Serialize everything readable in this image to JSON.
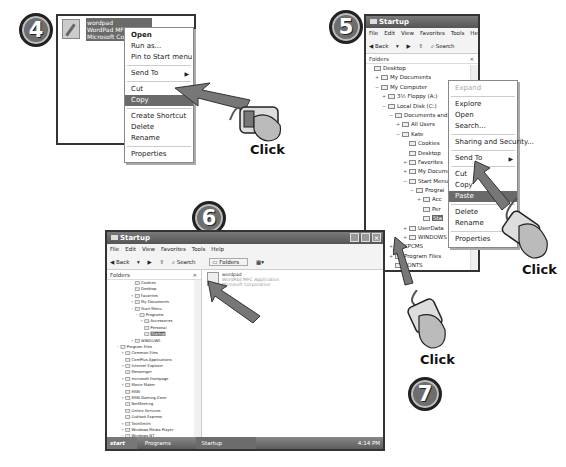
{
  "steps": [
    {
      "number": "4"
    },
    {
      "number": "5"
    },
    {
      "number": "6"
    },
    {
      "number": "7"
    }
  ],
  "click_labels": [
    "Click",
    "Click",
    "Click"
  ],
  "step4": {
    "file": {
      "name": "wordpad",
      "type": "WordPad MFC",
      "company": "Microsoft Corp"
    },
    "context_menu": [
      {
        "label": "Open",
        "bold": true
      },
      {
        "label": "Run as..."
      },
      {
        "label": "Pin to Start menu"
      },
      {
        "sep": true
      },
      {
        "label": "Send To",
        "submenu": true
      },
      {
        "sep": true
      },
      {
        "label": "Cut"
      },
      {
        "label": "Copy",
        "selected": true
      },
      {
        "sep": true
      },
      {
        "label": "Create Shortcut"
      },
      {
        "label": "Delete"
      },
      {
        "label": "Rename"
      },
      {
        "sep": true
      },
      {
        "label": "Properties"
      }
    ]
  },
  "step5": {
    "window_title": "Startup",
    "menubar": [
      "File",
      "Edit",
      "View",
      "Favorites",
      "Tools",
      "Help"
    ],
    "toolbar": {
      "back": "Back",
      "search": "Search"
    },
    "folders_label": "Folders",
    "close_glyph": "×",
    "tree": [
      {
        "indent": 0,
        "label": "Desktop"
      },
      {
        "indent": 1,
        "pm": "+",
        "label": "My Documents"
      },
      {
        "indent": 1,
        "pm": "−",
        "label": "My Computer"
      },
      {
        "indent": 2,
        "pm": "+",
        "label": "3½ Floppy (A:)"
      },
      {
        "indent": 2,
        "pm": "−",
        "label": "Local Disk (C:)"
      },
      {
        "indent": 3,
        "pm": "−",
        "label": "Documents and Set"
      },
      {
        "indent": 4,
        "pm": "+",
        "label": "All Users"
      },
      {
        "indent": 4,
        "pm": "−",
        "label": "Kate"
      },
      {
        "indent": 5,
        "label": "Cookies"
      },
      {
        "indent": 5,
        "label": "Desktop"
      },
      {
        "indent": 5,
        "pm": "+",
        "label": "Favorites"
      },
      {
        "indent": 5,
        "pm": "+",
        "label": "My Documen"
      },
      {
        "indent": 5,
        "pm": "−",
        "label": "Start Menu"
      },
      {
        "indent": 6,
        "pm": "−",
        "label": "Prograi"
      },
      {
        "indent": 7,
        "pm": "+",
        "label": "Acc"
      },
      {
        "indent": 7,
        "label": "Per"
      },
      {
        "indent": 7,
        "label": "Sta",
        "selected": true
      },
      {
        "indent": 5,
        "pm": "+",
        "label": "UserData"
      },
      {
        "indent": 5,
        "pm": "+",
        "label": "WINDOWS"
      },
      {
        "indent": 3,
        "pm": "+",
        "label": "KPCMS"
      },
      {
        "indent": 3,
        "pm": "+",
        "label": "Program Files"
      },
      {
        "indent": 3,
        "label": "PONTS"
      },
      {
        "indent": 3,
        "label": "WINDOWS"
      },
      {
        "indent": 2,
        "label": "N (D:)"
      }
    ],
    "context_menu": [
      {
        "label": "Expand",
        "disabled": true
      },
      {
        "sep": true
      },
      {
        "label": "Explore"
      },
      {
        "label": "Open"
      },
      {
        "label": "Search..."
      },
      {
        "sep": true
      },
      {
        "label": "Sharing and Security..."
      },
      {
        "sep": true
      },
      {
        "label": "Send To",
        "submenu": true
      },
      {
        "sep": true
      },
      {
        "label": "Cut"
      },
      {
        "label": "Copy"
      },
      {
        "label": "Paste",
        "selected": true
      },
      {
        "sep": true
      },
      {
        "label": "Delete"
      },
      {
        "label": "Rename"
      },
      {
        "sep": true
      },
      {
        "label": "Properties"
      }
    ]
  },
  "step6": {
    "window_title": "Startup",
    "menubar": [
      "File",
      "Edit",
      "View",
      "Favorites",
      "Tools",
      "Help"
    ],
    "toolbar": {
      "back": "Back",
      "search": "Search",
      "folders": "Folders"
    },
    "folders_label": "Folders",
    "close_glyph": "×",
    "file": {
      "name": "wordpad",
      "type": "WordPad MFC Application",
      "company": "Microsoft Corporation"
    },
    "tree": [
      {
        "indent": 5,
        "label": "Cookies"
      },
      {
        "indent": 5,
        "label": "Desktop"
      },
      {
        "indent": 5,
        "pm": "+",
        "label": "Favorites"
      },
      {
        "indent": 5,
        "pm": "+",
        "label": "My Documents"
      },
      {
        "indent": 5,
        "pm": "−",
        "label": "Start Menu"
      },
      {
        "indent": 6,
        "pm": "−",
        "label": "Programs"
      },
      {
        "indent": 7,
        "pm": "+",
        "label": "Accessories"
      },
      {
        "indent": 7,
        "label": "Personal"
      },
      {
        "indent": 7,
        "label": "Startup",
        "selected": true
      },
      {
        "indent": 5,
        "pm": "+",
        "label": "WINDOWS"
      },
      {
        "indent": 2,
        "pm": "−",
        "label": "Program Files"
      },
      {
        "indent": 3,
        "pm": "+",
        "label": "Common Files"
      },
      {
        "indent": 3,
        "label": "ComPlus Applications"
      },
      {
        "indent": 3,
        "pm": "+",
        "label": "Internet Explorer"
      },
      {
        "indent": 3,
        "label": "Messenger"
      },
      {
        "indent": 3,
        "pm": "+",
        "label": "microsoft frontpage"
      },
      {
        "indent": 3,
        "pm": "+",
        "label": "Movie Maker"
      },
      {
        "indent": 3,
        "label": "MSN"
      },
      {
        "indent": 3,
        "pm": "+",
        "label": "MSN Gaming Zone"
      },
      {
        "indent": 3,
        "label": "NetMeeting"
      },
      {
        "indent": 3,
        "label": "Online Services"
      },
      {
        "indent": 3,
        "label": "Outlook Express"
      },
      {
        "indent": 3,
        "pm": "+",
        "label": "TechSmith"
      },
      {
        "indent": 3,
        "pm": "+",
        "label": "Windows Media Player"
      },
      {
        "indent": 3,
        "pm": "−",
        "label": "Windows NT"
      },
      {
        "indent": 4,
        "label": "Accessories"
      },
      {
        "indent": 4,
        "label": "Pinball"
      }
    ],
    "taskbar": {
      "start": "start",
      "items": [
        "Programs",
        "Startup"
      ],
      "clock": "4:14 PM"
    }
  }
}
